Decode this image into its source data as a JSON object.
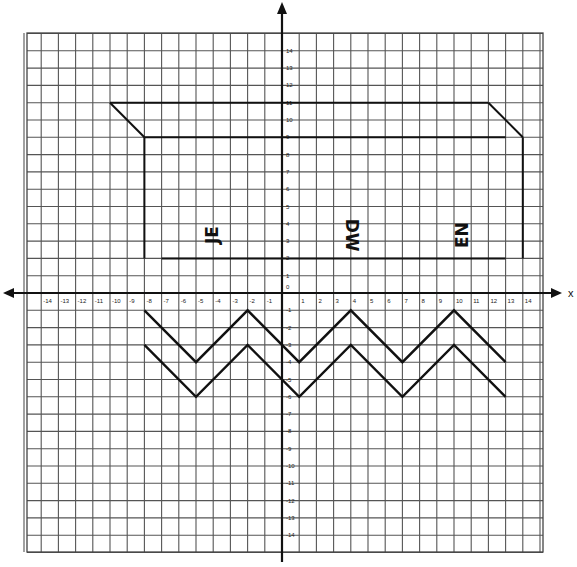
{
  "chart_data": {
    "type": "coordinate-plane-drawing",
    "title": "",
    "xlabel": "x",
    "ylabel": "",
    "xlim": [
      -15,
      15
    ],
    "ylim": [
      -15,
      15
    ],
    "grid": true,
    "x_ticks": [
      -14,
      -13,
      -12,
      -11,
      -10,
      -9,
      -8,
      -7,
      -6,
      -5,
      -4,
      -3,
      -2,
      -1,
      1,
      2,
      3,
      4,
      5,
      6,
      7,
      8,
      9,
      10,
      11,
      12,
      13,
      14
    ],
    "y_ticks": [
      14,
      13,
      12,
      11,
      10,
      9,
      8,
      7,
      6,
      5,
      4,
      3,
      2,
      1,
      -1,
      -2,
      -3,
      -4,
      -5,
      -6,
      -7,
      -8,
      -9,
      -10,
      -11,
      -12,
      -13,
      -14
    ],
    "origin_label": "0",
    "shapes": [
      {
        "name": "banner-outer-top",
        "points": [
          [
            -10,
            11
          ],
          [
            12,
            11
          ]
        ]
      },
      {
        "name": "banner-left-diagonal",
        "points": [
          [
            -10,
            11
          ],
          [
            -8,
            9
          ]
        ]
      },
      {
        "name": "banner-right-diagonal",
        "points": [
          [
            12,
            11
          ],
          [
            14,
            9
          ]
        ]
      },
      {
        "name": "banner-inner-top",
        "points": [
          [
            -8,
            9
          ],
          [
            13,
            9
          ]
        ]
      },
      {
        "name": "banner-left-side",
        "points": [
          [
            -8,
            9
          ],
          [
            -8,
            2
          ]
        ]
      },
      {
        "name": "banner-right-side",
        "points": [
          [
            14,
            9
          ],
          [
            14,
            2
          ]
        ]
      },
      {
        "name": "banner-bottom",
        "points": [
          [
            -7,
            2
          ],
          [
            13,
            2
          ]
        ]
      }
    ],
    "zigzags": [
      {
        "name": "zigzag-upper",
        "points": [
          [
            -8,
            -1
          ],
          [
            -5,
            -4
          ],
          [
            -2,
            -1
          ],
          [
            1,
            -4
          ],
          [
            4,
            -1
          ],
          [
            7,
            -4
          ],
          [
            10,
            -1
          ],
          [
            13,
            -4
          ]
        ]
      },
      {
        "name": "zigzag-lower",
        "points": [
          [
            -8,
            -3
          ],
          [
            -5,
            -6
          ],
          [
            -2,
            -3
          ],
          [
            1,
            -6
          ],
          [
            4,
            -3
          ],
          [
            7,
            -6
          ],
          [
            10,
            -3
          ],
          [
            13,
            -6
          ]
        ]
      }
    ],
    "annotations": [
      {
        "text": "JE",
        "x": -4,
        "y": 3,
        "rotation": -90
      },
      {
        "text": "DW",
        "x": 4,
        "y": 3,
        "rotation": 90
      },
      {
        "text": "EN",
        "x": 10.5,
        "y": 3,
        "rotation": -90
      }
    ]
  },
  "labels": {
    "x_axis": "x",
    "origin": "0"
  }
}
